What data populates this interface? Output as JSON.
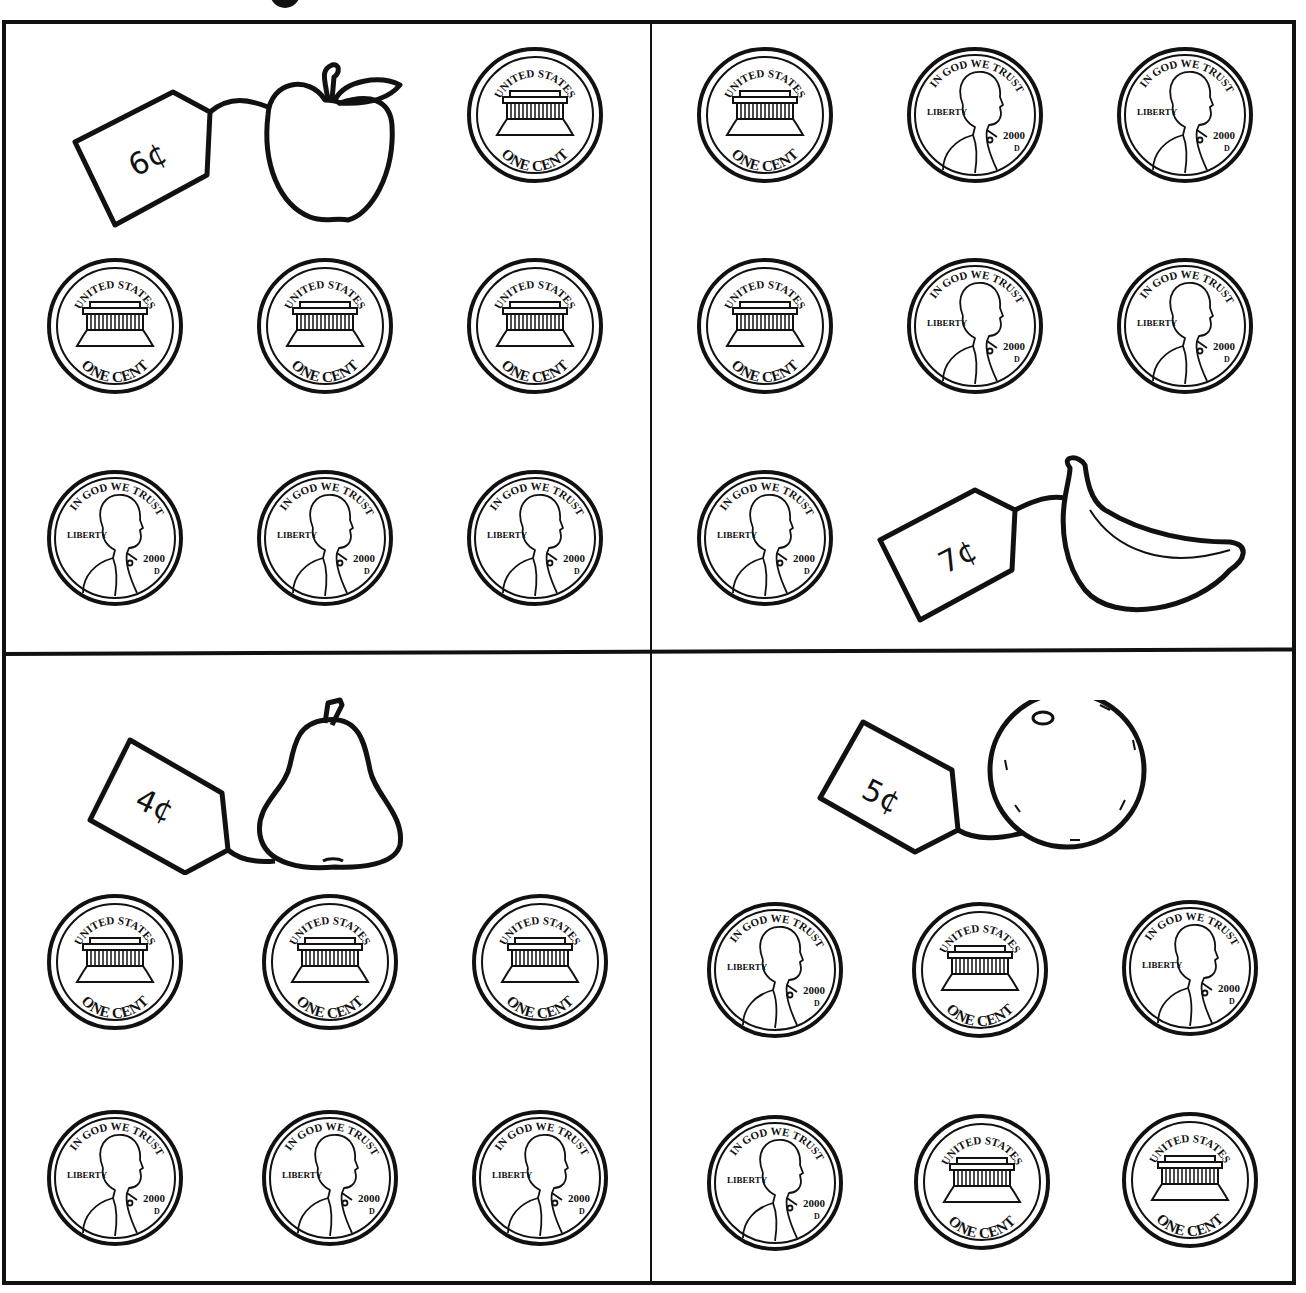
{
  "worksheet": {
    "quadrants": [
      {
        "id": "top-left",
        "item": "apple",
        "price_label": "6¢",
        "coins": [
          {
            "side": "tails",
            "position": [
              465,
              45
            ]
          },
          {
            "side": "tails",
            "position": [
              45,
              256
            ]
          },
          {
            "side": "tails",
            "position": [
              255,
              256
            ]
          },
          {
            "side": "tails",
            "position": [
              465,
              256
            ]
          },
          {
            "side": "heads",
            "position": [
              45,
              468
            ]
          },
          {
            "side": "heads",
            "position": [
              255,
              468
            ]
          },
          {
            "side": "heads",
            "position": [
              465,
              468
            ]
          }
        ]
      },
      {
        "id": "top-right",
        "item": "banana",
        "price_label": "7¢",
        "coins": [
          {
            "side": "tails",
            "position": [
              695,
              45
            ]
          },
          {
            "side": "heads",
            "position": [
              905,
              45
            ]
          },
          {
            "side": "heads",
            "position": [
              1115,
              45
            ]
          },
          {
            "side": "tails",
            "position": [
              695,
              256
            ]
          },
          {
            "side": "heads",
            "position": [
              905,
              256
            ]
          },
          {
            "side": "heads",
            "position": [
              1115,
              256
            ]
          },
          {
            "side": "heads",
            "position": [
              695,
              468
            ]
          }
        ]
      },
      {
        "id": "bottom-left",
        "item": "pear",
        "price_label": "4¢",
        "coins": [
          {
            "side": "tails",
            "position": [
              45,
              892
            ]
          },
          {
            "side": "tails",
            "position": [
              260,
              892
            ]
          },
          {
            "side": "tails",
            "position": [
              470,
              892
            ]
          },
          {
            "side": "heads",
            "position": [
              45,
              1108
            ]
          },
          {
            "side": "heads",
            "position": [
              260,
              1108
            ]
          },
          {
            "side": "heads",
            "position": [
              470,
              1108
            ]
          }
        ]
      },
      {
        "id": "bottom-right",
        "item": "orange",
        "price_label": "5¢",
        "coins": [
          {
            "side": "heads",
            "position": [
              705,
              900
            ]
          },
          {
            "side": "tails",
            "position": [
              910,
              900
            ]
          },
          {
            "side": "heads",
            "position": [
              1120,
              898
            ]
          },
          {
            "side": "heads",
            "position": [
              705,
              1113
            ]
          },
          {
            "side": "tails",
            "position": [
              912,
              1112
            ]
          },
          {
            "side": "tails",
            "position": [
              1120,
              1110
            ]
          }
        ]
      }
    ],
    "coin_text": {
      "tails_top": "UNITED STATES",
      "tails_bottom": "ONE CENT",
      "heads_top": "IN GOD WE TRUST",
      "heads_left": "LIBERTY",
      "heads_year": "2000",
      "heads_mint": "D"
    }
  }
}
